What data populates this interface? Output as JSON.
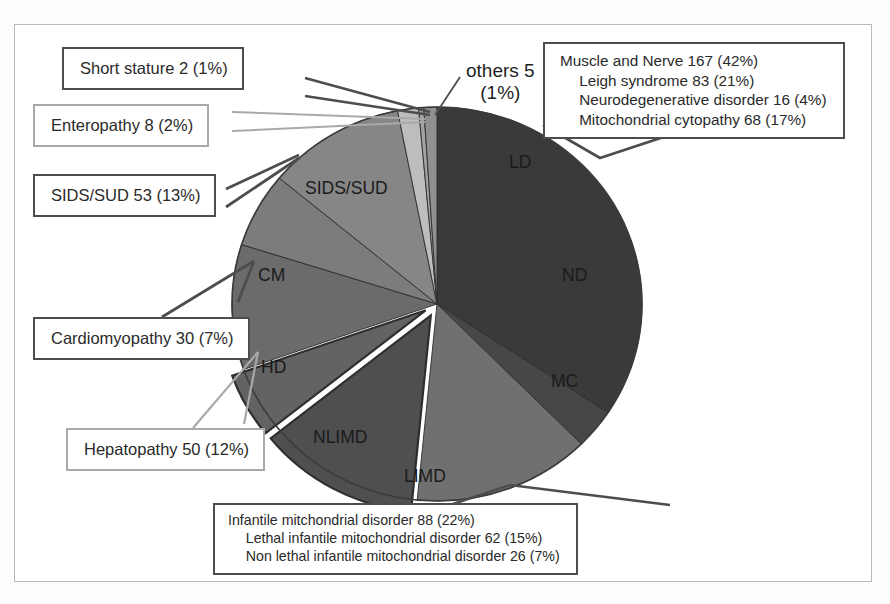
{
  "figure": {
    "kind": "pie-chart-with-callouts"
  },
  "chart_data": {
    "type": "pie",
    "title": "",
    "total": 399,
    "legend_position": "callouts",
    "grid": false,
    "labels": [
      "LD",
      "ND",
      "MC",
      "LIMD",
      "NLIMD",
      "HD",
      "CM",
      "SIDS/SUD",
      "Enteropathy",
      "Short stature",
      "others"
    ],
    "values": [
      167,
      16,
      68,
      62,
      26,
      50,
      30,
      53,
      8,
      2,
      5
    ],
    "percents": [
      42,
      4,
      17,
      15,
      7,
      12,
      7,
      13,
      2,
      1,
      1
    ],
    "slices": [
      {
        "key": "LD",
        "label": "LD",
        "value": 167,
        "percent": 42,
        "color": "#3a3a3a",
        "exploded": false
      },
      {
        "key": "ND",
        "label": "ND",
        "value": 16,
        "percent": 4,
        "color": "#474747",
        "exploded": false
      },
      {
        "key": "MC",
        "label": "MC",
        "value": 68,
        "percent": 17,
        "color": "#707070",
        "exploded": false
      },
      {
        "key": "LIMD",
        "label": "LIMD",
        "value": 62,
        "percent": 15,
        "color": "#4f4f4f",
        "exploded": true
      },
      {
        "key": "NLIMD",
        "label": "NLIMD",
        "value": 26,
        "percent": 7,
        "color": "#636363",
        "exploded": true
      },
      {
        "key": "HD",
        "label": "HD",
        "value": 50,
        "percent": 12,
        "color": "#6b6b6b",
        "exploded": false
      },
      {
        "key": "CM",
        "label": "CM",
        "value": 30,
        "percent": 7,
        "color": "#7c7c7c",
        "exploded": false
      },
      {
        "key": "SIDS/SUD",
        "label": "SIDS/SUD",
        "value": 53,
        "percent": 13,
        "color": "#868686",
        "exploded": false
      },
      {
        "key": "Enteropathy",
        "label": "",
        "value": 8,
        "percent": 2,
        "color": "#bdbdbd",
        "exploded": false
      },
      {
        "key": "Short stature",
        "label": "",
        "value": 2,
        "percent": 1,
        "color": "#a3a3a3",
        "exploded": false
      },
      {
        "key": "others",
        "label": "others",
        "value": 5,
        "percent": 1,
        "color": "#909090",
        "exploded": false
      }
    ]
  },
  "slice_labels": {
    "ld": "LD",
    "nd": "ND",
    "mc": "MC",
    "limd": "LIMD",
    "nlimd": "NLIMD",
    "hd": "HD",
    "cm": "CM",
    "sids_sud": "SIDS/SUD"
  },
  "others_label": {
    "line1": "others 5",
    "line2": "(1%)"
  },
  "callouts": {
    "short_stature": {
      "line1": "Short stature 2 (1%)"
    },
    "enteropathy": {
      "line1": "Enteropathy 8 (2%)"
    },
    "sids_sud": {
      "line1": "SIDS/SUD 53 (13%)"
    },
    "cardiomyopathy": {
      "line1": "Cardiomyopathy 30 (7%)"
    },
    "hepatopathy": {
      "line1": "Hepatopathy 50 (12%)"
    },
    "muscle_nerve": {
      "line1": "Muscle and Nerve 167 (42%)",
      "line2": "Leigh syndrome 83 (21%)",
      "line3": "Neurodegenerative disorder 16 (4%)",
      "line4": "Mitochondrial cytopathy 68 (17%)"
    },
    "infantile": {
      "line1": "Infantile mitchondrial disorder 88 (22%)",
      "line2": "Lethal infantile mitochondrial disorder 62 (15%)",
      "line3": "Non lethal infantile mitochondrial disorder 26 (7%)"
    }
  },
  "colors": {
    "border_dark": "#4d4d4d",
    "border_light": "#a9a9a9",
    "frame": "#b9b9b9",
    "text": "#2a2a2a",
    "background": "#ffffff"
  }
}
